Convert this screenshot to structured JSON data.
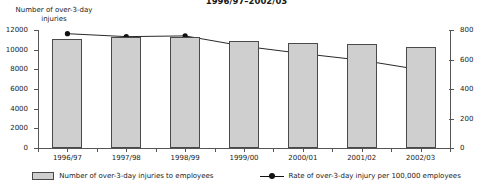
{
  "chart_data": {
    "type": "bar",
    "title": "1996/97–2002/03",
    "xlabel": "",
    "ylabel": "Number of over-3-day injuries",
    "ylabel_right": "",
    "categories": [
      "1996/97",
      "1997/98",
      "1998/99",
      "1999/00",
      "2000/01",
      "2001/02",
      "2002/03"
    ],
    "ylim": [
      0,
      12000
    ],
    "ylim_right": [
      0,
      800
    ],
    "yticks": [
      0,
      2000,
      4000,
      6000,
      8000,
      10000,
      12000
    ],
    "yticks_right": [
      0,
      200,
      400,
      600,
      800
    ],
    "grid": false,
    "legend_position": "bottom",
    "series": [
      {
        "name": "Number of over-3-day injuries to employees",
        "type": "bar",
        "axis": "left",
        "color": "#cfcfcf",
        "values": [
          11100,
          11250,
          11250,
          10900,
          10700,
          10600,
          10300
        ]
      },
      {
        "name": "Rate of over-3-day injury per 100,000 employees",
        "type": "line",
        "axis": "right",
        "color": "#111111",
        "values": [
          775,
          755,
          760,
          690,
          640,
          595,
          530
        ]
      }
    ]
  },
  "axes": {
    "left_label_line1": "Number of over-3-day",
    "left_label_line2": "injuries",
    "tick_labels_left": [
      "12000",
      "10000",
      "8000",
      "6000",
      "4000",
      "2000",
      "0"
    ],
    "tick_labels_right": [
      "800",
      "600",
      "400",
      "200",
      "0"
    ]
  },
  "legend": {
    "items": [
      {
        "label": "Number of over-3-day injuries to employees",
        "marker": "bar-swatch"
      },
      {
        "label": "Rate of over-3-day injury per 100,000 employees",
        "marker": "line-marker"
      }
    ]
  }
}
